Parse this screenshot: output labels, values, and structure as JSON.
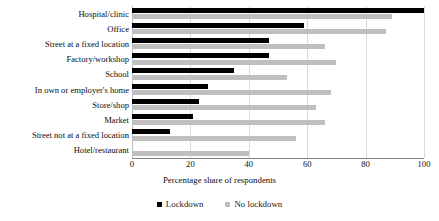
{
  "chart_data": {
    "type": "bar",
    "orientation": "horizontal",
    "title": "",
    "xlabel": "Percentage share of respondents",
    "ylabel": "",
    "xlim": [
      0,
      100
    ],
    "xticks": [
      0,
      20,
      40,
      60,
      80,
      100
    ],
    "grid": true,
    "grid_axis": "x",
    "legend_position": "bottom",
    "categories": [
      "Hospital/clinic",
      "Office",
      "Street at a fixed location",
      "Factory/workshop",
      "School",
      "In own or employer's home",
      "Store/shop",
      "Market",
      "Street not at a fixed location",
      "Hotel/restaurant"
    ],
    "series": [
      {
        "name": "Lockdown",
        "color": "#000000",
        "values": [
          100,
          59,
          47,
          47,
          35,
          26,
          23,
          21,
          13,
          0
        ]
      },
      {
        "name": "No lockdown",
        "color": "#bfbfbf",
        "values": [
          89,
          87,
          66,
          70,
          53,
          68,
          63,
          66,
          56,
          40
        ]
      }
    ]
  },
  "axis": {
    "title": "Percentage share of respondents"
  },
  "legend": {
    "items": [
      {
        "label": "Lockdown",
        "color": "#000000"
      },
      {
        "label": "No lockdown",
        "color": "#bfbfbf"
      }
    ]
  }
}
